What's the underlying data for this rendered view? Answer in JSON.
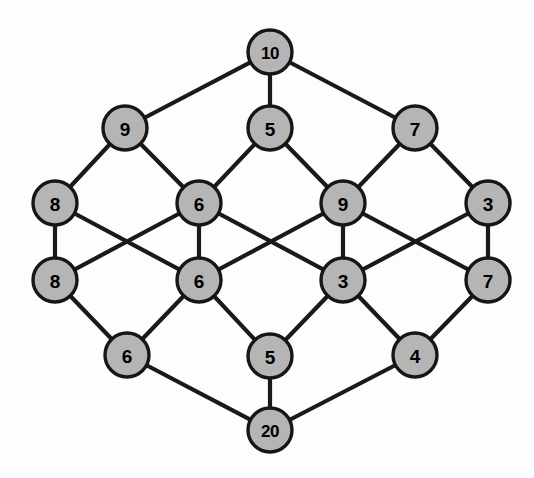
{
  "figure": {
    "background_color": "#fdfdfd",
    "node_fill_color": "#b5b5b5",
    "node_stroke_color": "#161616",
    "edge_color": "#1a1a1a",
    "label_color": "#000000"
  },
  "graph_data": {
    "type": "node-link-diagram",
    "layout": "hexagonal-lattice",
    "node_count": 18,
    "edge_count": 30,
    "nodes": [
      {
        "id": "n0",
        "label": "10",
        "x": 270,
        "y": 52,
        "r": 22
      },
      {
        "id": "n1",
        "label": "9",
        "x": 125,
        "y": 128,
        "r": 22
      },
      {
        "id": "n2",
        "label": "5",
        "x": 270,
        "y": 128,
        "r": 22
      },
      {
        "id": "n3",
        "label": "7",
        "x": 415,
        "y": 128,
        "r": 22
      },
      {
        "id": "n4",
        "label": "8",
        "x": 55,
        "y": 203,
        "r": 22
      },
      {
        "id": "n5",
        "label": "6",
        "x": 199,
        "y": 203,
        "r": 22
      },
      {
        "id": "n6",
        "label": "9",
        "x": 343,
        "y": 203,
        "r": 22
      },
      {
        "id": "n7",
        "label": "3",
        "x": 488,
        "y": 203,
        "r": 22
      },
      {
        "id": "n8",
        "label": "8",
        "x": 55,
        "y": 280,
        "r": 22
      },
      {
        "id": "n9",
        "label": "6",
        "x": 199,
        "y": 280,
        "r": 22
      },
      {
        "id": "n10",
        "label": "3",
        "x": 343,
        "y": 280,
        "r": 22
      },
      {
        "id": "n11",
        "label": "7",
        "x": 488,
        "y": 280,
        "r": 22
      },
      {
        "id": "n12",
        "label": "6",
        "x": 127,
        "y": 355,
        "r": 22
      },
      {
        "id": "n13",
        "label": "5",
        "x": 270,
        "y": 356,
        "r": 22
      },
      {
        "id": "n14",
        "label": "4",
        "x": 415,
        "y": 355,
        "r": 22
      },
      {
        "id": "n15",
        "label": "20",
        "x": 270,
        "y": 430,
        "r": 22
      }
    ],
    "edges": [
      {
        "source": "n0",
        "target": "n1"
      },
      {
        "source": "n0",
        "target": "n2"
      },
      {
        "source": "n0",
        "target": "n3"
      },
      {
        "source": "n1",
        "target": "n4"
      },
      {
        "source": "n1",
        "target": "n5"
      },
      {
        "source": "n2",
        "target": "n5"
      },
      {
        "source": "n2",
        "target": "n6"
      },
      {
        "source": "n3",
        "target": "n6"
      },
      {
        "source": "n3",
        "target": "n7"
      },
      {
        "source": "n4",
        "target": "n8"
      },
      {
        "source": "n4",
        "target": "n9"
      },
      {
        "source": "n8",
        "target": "n5"
      },
      {
        "source": "n5",
        "target": "n9"
      },
      {
        "source": "n5",
        "target": "n10"
      },
      {
        "source": "n6",
        "target": "n9"
      },
      {
        "source": "n6",
        "target": "n10"
      },
      {
        "source": "n6",
        "target": "n11"
      },
      {
        "source": "n7",
        "target": "n10"
      },
      {
        "source": "n7",
        "target": "n11"
      },
      {
        "source": "n8",
        "target": "n12"
      },
      {
        "source": "n9",
        "target": "n12"
      },
      {
        "source": "n9",
        "target": "n13"
      },
      {
        "source": "n10",
        "target": "n13"
      },
      {
        "source": "n10",
        "target": "n14"
      },
      {
        "source": "n11",
        "target": "n14"
      },
      {
        "source": "n12",
        "target": "n15"
      },
      {
        "source": "n13",
        "target": "n15"
      },
      {
        "source": "n14",
        "target": "n15"
      }
    ]
  }
}
